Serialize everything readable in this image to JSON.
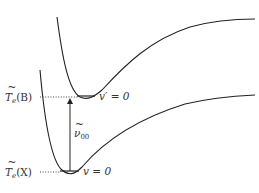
{
  "diagram": {
    "type": "potential-energy-curves",
    "states": [
      {
        "id": "B",
        "label_base": "T",
        "label_sub": "e",
        "label_arg": "(B)",
        "level_label": "v′ = 0",
        "level_y": 97
      },
      {
        "id": "X",
        "label_base": "T",
        "label_sub": "e",
        "label_arg": "(X)",
        "level_label": "v = 0",
        "level_y": 172
      }
    ],
    "transition": {
      "label_base": "ν",
      "label_sub": "00",
      "direction": "up"
    },
    "colors": {
      "line": "#222222",
      "text": "#333333",
      "background": "#ffffff"
    }
  }
}
